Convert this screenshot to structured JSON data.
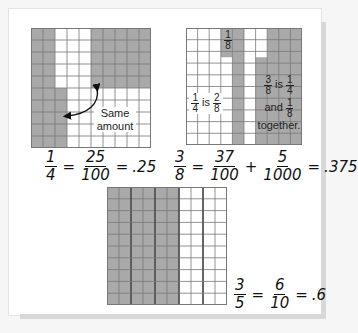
{
  "colors": {
    "shaded": "#a9a9a9",
    "unshaded": "#ffffff",
    "grid_line": "#777777",
    "thick_line": "#555555"
  },
  "grid1": {
    "label": "Same amount",
    "shaded_description": "cols 0-1 full, col 2 rows 5-9, cols 5-9 rows 0-4",
    "equation": {
      "lhs": {
        "num": "1",
        "den": "4"
      },
      "mid": {
        "num": "25",
        "den": "100"
      },
      "equals": "=",
      "decimal": ".25"
    }
  },
  "grid2": {
    "top_label": {
      "num": "1",
      "den": "8"
    },
    "left_label": {
      "a_num": "1",
      "a_den": "4",
      "is": "is",
      "b_num": "2",
      "b_den": "8"
    },
    "right_label": {
      "a_num": "3",
      "a_den": "8",
      "is": "is",
      "b_num": "1",
      "b_den": "4",
      "and": "and",
      "c_num": "1",
      "c_den": "8",
      "together": "together."
    },
    "equation": {
      "lhs": {
        "num": "3",
        "den": "8"
      },
      "t1": {
        "num": "37",
        "den": "100"
      },
      "plus": "+",
      "t2": {
        "num": "5",
        "den": "1000"
      },
      "equals": "=",
      "decimal": ".375"
    }
  },
  "grid3": {
    "shaded_columns": 6,
    "total_columns": 10,
    "equation": {
      "lhs": {
        "num": "3",
        "den": "5"
      },
      "mid": {
        "num": "6",
        "den": "10"
      },
      "equals": "=",
      "decimal": ".6"
    }
  }
}
